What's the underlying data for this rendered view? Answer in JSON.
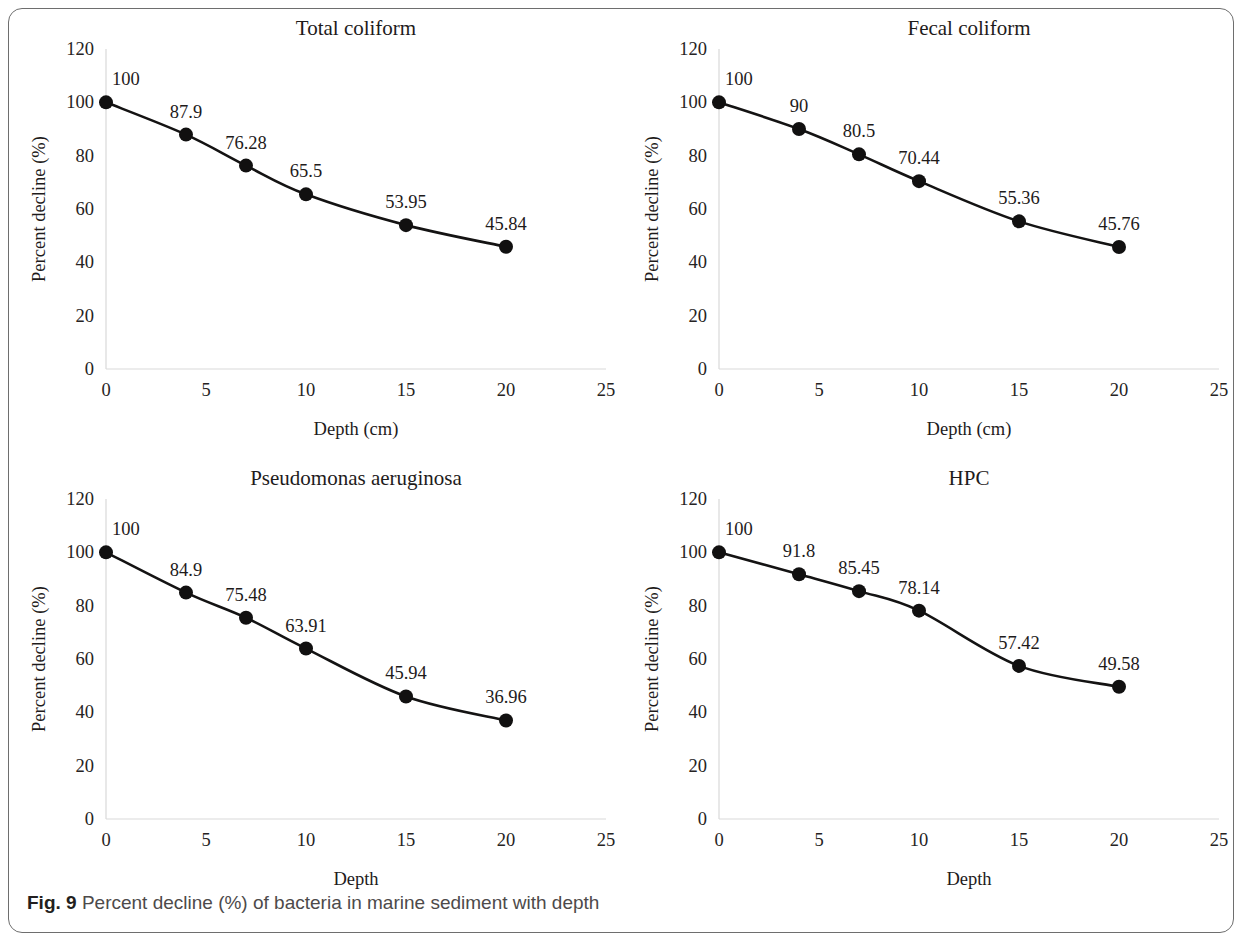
{
  "figure": {
    "caption_label": "Fig. 9",
    "caption_text": "Percent decline (%) of bacteria in marine sediment with depth",
    "frame_color": "#6e6e6e",
    "line_color": "#141313",
    "marker_color": "#111010",
    "axis_color": "#d9d9d9"
  },
  "chart_data": [
    {
      "type": "line",
      "title": "Total coliform",
      "xlabel": "Depth (cm)",
      "ylabel": "Percent decline (%)",
      "x": [
        0,
        4,
        7,
        10,
        15,
        20
      ],
      "values": [
        100,
        87.9,
        76.28,
        65.5,
        53.95,
        45.84
      ],
      "point_labels": [
        "100",
        "87.9",
        "76.28",
        "65.5",
        "53.95",
        "45.84"
      ],
      "xticks": [
        "0",
        "5",
        "10",
        "15",
        "20",
        "25"
      ],
      "xtick_values": [
        0,
        5,
        10,
        15,
        20,
        25
      ],
      "yticks": [
        "0",
        "20",
        "40",
        "60",
        "80",
        "100",
        "120"
      ],
      "ytick_values": [
        0,
        20,
        40,
        60,
        80,
        100,
        120
      ],
      "xlim": [
        0,
        25
      ],
      "ylim": [
        0,
        120
      ],
      "grid": false,
      "legend": "none"
    },
    {
      "type": "line",
      "title": "Fecal coliform",
      "xlabel": "Depth (cm)",
      "ylabel": "Percent decline (%)",
      "x": [
        0,
        4,
        7,
        10,
        15,
        20
      ],
      "values": [
        100,
        90,
        80.5,
        70.44,
        55.36,
        45.76
      ],
      "point_labels": [
        "100",
        "90",
        "80.5",
        "70.44",
        "55.36",
        "45.76"
      ],
      "xticks": [
        "0",
        "5",
        "10",
        "15",
        "20",
        "25"
      ],
      "xtick_values": [
        0,
        5,
        10,
        15,
        20,
        25
      ],
      "yticks": [
        "0",
        "20",
        "40",
        "60",
        "80",
        "100",
        "120"
      ],
      "ytick_values": [
        0,
        20,
        40,
        60,
        80,
        100,
        120
      ],
      "xlim": [
        0,
        25
      ],
      "ylim": [
        0,
        120
      ],
      "grid": false,
      "legend": "none"
    },
    {
      "type": "line",
      "title": "Pseudomonas aeruginosa",
      "xlabel": "Depth",
      "ylabel": "Percent decline (%)",
      "x": [
        0,
        4,
        7,
        10,
        15,
        20
      ],
      "values": [
        100,
        84.9,
        75.48,
        63.91,
        45.94,
        36.96
      ],
      "point_labels": [
        "100",
        "84.9",
        "75.48",
        "63.91",
        "45.94",
        "36.96"
      ],
      "xticks": [
        "0",
        "5",
        "10",
        "15",
        "20",
        "25"
      ],
      "xtick_values": [
        0,
        5,
        10,
        15,
        20,
        25
      ],
      "yticks": [
        "0",
        "20",
        "40",
        "60",
        "80",
        "100",
        "120"
      ],
      "ytick_values": [
        0,
        20,
        40,
        60,
        80,
        100,
        120
      ],
      "xlim": [
        0,
        25
      ],
      "ylim": [
        0,
        120
      ],
      "grid": false,
      "legend": "none"
    },
    {
      "type": "line",
      "title": "HPC",
      "xlabel": "Depth",
      "ylabel": "Percent decline (%)",
      "x": [
        0,
        4,
        7,
        10,
        15,
        20
      ],
      "values": [
        100,
        91.8,
        85.45,
        78.14,
        57.42,
        49.58
      ],
      "point_labels": [
        "100",
        "91.8",
        "85.45",
        "78.14",
        "57.42",
        "49.58"
      ],
      "xticks": [
        "0",
        "5",
        "10",
        "15",
        "20",
        "25"
      ],
      "xtick_values": [
        0,
        5,
        10,
        15,
        20,
        25
      ],
      "yticks": [
        "0",
        "20",
        "40",
        "60",
        "80",
        "100",
        "120"
      ],
      "ytick_values": [
        0,
        20,
        40,
        60,
        80,
        100,
        120
      ],
      "xlim": [
        0,
        25
      ],
      "ylim": [
        0,
        120
      ],
      "grid": false,
      "legend": "none"
    }
  ]
}
